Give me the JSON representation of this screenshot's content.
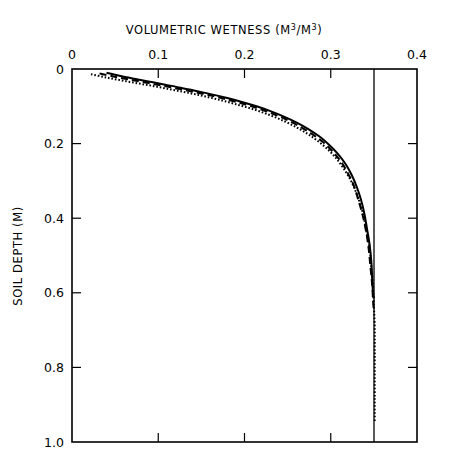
{
  "chart_data": {
    "type": "line",
    "title": "VOLUMETRIC WETNESS (M3/M3)",
    "title_parts": {
      "main": "VOLUMETRIC WETNESS (M",
      "sup1": "3",
      "mid": "/M",
      "sup2": "3",
      "tail": ")"
    },
    "xlabel": "VOLUMETRIC WETNESS (M3/M3)",
    "ylabel": "SOIL DEPTH (M)",
    "xlim": [
      0,
      0.4
    ],
    "ylim": [
      0,
      1.0
    ],
    "y_axis_inverted": true,
    "x_axis_position": "top",
    "grid": false,
    "legend": "none",
    "xticks": [
      0,
      0.1,
      0.2,
      0.3,
      0.4
    ],
    "xtick_labels": [
      "0",
      "0.1",
      "0.2",
      "0.3",
      "0.4"
    ],
    "yticks": [
      0,
      0.2,
      0.4,
      0.6,
      0.8,
      1.0
    ],
    "ytick_labels": [
      "0",
      "0.2",
      "0.4",
      "0.6",
      "0.8",
      "1.0"
    ],
    "saturation_value": 0.35,
    "annotations": [
      {
        "name": "saturation-asymptote",
        "description": "vertical solid line at volumetric wetness 0.35 spanning full soil depth",
        "x": 0.35
      }
    ],
    "series": [
      {
        "name": "profile-solid",
        "style": "solid",
        "points": [
          [
            0.04,
            0.01
          ],
          [
            0.055,
            0.018
          ],
          [
            0.072,
            0.026
          ],
          [
            0.09,
            0.034
          ],
          [
            0.108,
            0.042
          ],
          [
            0.126,
            0.05
          ],
          [
            0.144,
            0.059
          ],
          [
            0.162,
            0.068
          ],
          [
            0.18,
            0.078
          ],
          [
            0.198,
            0.089
          ],
          [
            0.214,
            0.1
          ],
          [
            0.23,
            0.113
          ],
          [
            0.245,
            0.127
          ],
          [
            0.26,
            0.143
          ],
          [
            0.274,
            0.161
          ],
          [
            0.287,
            0.181
          ],
          [
            0.298,
            0.203
          ],
          [
            0.308,
            0.227
          ],
          [
            0.317,
            0.254
          ],
          [
            0.324,
            0.283
          ],
          [
            0.33,
            0.315
          ],
          [
            0.335,
            0.35
          ],
          [
            0.339,
            0.388
          ],
          [
            0.342,
            0.428
          ],
          [
            0.345,
            0.47
          ],
          [
            0.347,
            0.515
          ],
          [
            0.348,
            0.56
          ],
          [
            0.349,
            0.6
          ],
          [
            0.35,
            0.615
          ]
        ]
      },
      {
        "name": "profile-dashed",
        "style": "dashed",
        "points": [
          [
            0.032,
            0.012
          ],
          [
            0.048,
            0.02
          ],
          [
            0.066,
            0.028
          ],
          [
            0.085,
            0.036
          ],
          [
            0.104,
            0.044
          ],
          [
            0.123,
            0.053
          ],
          [
            0.142,
            0.062
          ],
          [
            0.161,
            0.071
          ],
          [
            0.18,
            0.082
          ],
          [
            0.198,
            0.093
          ],
          [
            0.216,
            0.106
          ],
          [
            0.233,
            0.12
          ],
          [
            0.249,
            0.136
          ],
          [
            0.264,
            0.154
          ],
          [
            0.278,
            0.174
          ],
          [
            0.291,
            0.196
          ],
          [
            0.302,
            0.221
          ],
          [
            0.312,
            0.249
          ],
          [
            0.32,
            0.28
          ],
          [
            0.327,
            0.314
          ],
          [
            0.332,
            0.351
          ],
          [
            0.337,
            0.392
          ],
          [
            0.341,
            0.436
          ],
          [
            0.344,
            0.482
          ],
          [
            0.346,
            0.53
          ],
          [
            0.348,
            0.578
          ],
          [
            0.349,
            0.62
          ],
          [
            0.35,
            0.65
          ]
        ]
      },
      {
        "name": "profile-dotted",
        "style": "dotted",
        "points": [
          [
            0.022,
            0.014
          ],
          [
            0.038,
            0.022
          ],
          [
            0.056,
            0.03
          ],
          [
            0.075,
            0.038
          ],
          [
            0.095,
            0.046
          ],
          [
            0.115,
            0.055
          ],
          [
            0.135,
            0.064
          ],
          [
            0.155,
            0.074
          ],
          [
            0.175,
            0.085
          ],
          [
            0.194,
            0.097
          ],
          [
            0.213,
            0.11
          ],
          [
            0.231,
            0.125
          ],
          [
            0.248,
            0.142
          ],
          [
            0.264,
            0.161
          ],
          [
            0.279,
            0.183
          ],
          [
            0.293,
            0.208
          ],
          [
            0.305,
            0.236
          ],
          [
            0.315,
            0.267
          ],
          [
            0.324,
            0.302
          ],
          [
            0.331,
            0.341
          ],
          [
            0.337,
            0.384
          ],
          [
            0.341,
            0.43
          ],
          [
            0.345,
            0.479
          ],
          [
            0.347,
            0.53
          ],
          [
            0.349,
            0.582
          ],
          [
            0.35,
            0.635
          ],
          [
            0.351,
            0.69
          ],
          [
            0.351,
            0.75
          ],
          [
            0.351,
            0.82
          ],
          [
            0.351,
            0.89
          ],
          [
            0.351,
            0.945
          ]
        ]
      }
    ]
  }
}
